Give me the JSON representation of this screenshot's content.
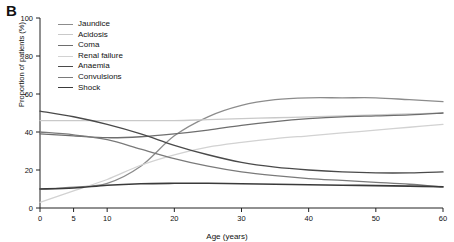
{
  "panel": {
    "label": "B"
  },
  "chart_data": {
    "type": "line",
    "title": "",
    "xlabel": "Age (years)",
    "ylabel": "Proportion of patients (%)",
    "xlim": [
      0,
      60
    ],
    "ylim": [
      0,
      100
    ],
    "xticks": [
      0,
      5,
      10,
      20,
      30,
      40,
      50,
      60
    ],
    "yticks": [
      0,
      20,
      40,
      60,
      80,
      100
    ],
    "grid": false,
    "legend_position": "top-left",
    "x": [
      0,
      5,
      10,
      15,
      20,
      25,
      30,
      35,
      40,
      45,
      50,
      55,
      60
    ],
    "series": [
      {
        "name": "Jaundice",
        "color": "#8c8c8c",
        "width": 1.3,
        "values": [
          10,
          11,
          13,
          22,
          38,
          48,
          54,
          57,
          58,
          58,
          58,
          57,
          56
        ]
      },
      {
        "name": "Acidosis",
        "color": "#c9c9c9",
        "width": 1.3,
        "values": [
          46,
          46,
          46,
          46,
          46,
          46.5,
          47,
          47.5,
          48,
          48.5,
          49,
          49.5,
          50
        ]
      },
      {
        "name": "Coma",
        "color": "#6e6e6e",
        "width": 1.3,
        "values": [
          39,
          38,
          37,
          37.5,
          39,
          41,
          43.5,
          45.5,
          47,
          48,
          48.5,
          49,
          50
        ]
      },
      {
        "name": "Renal failure",
        "color": "#d2d2d2",
        "width": 1.3,
        "values": [
          3,
          9,
          15,
          22.5,
          28,
          32,
          34.5,
          36.5,
          38,
          39.5,
          41,
          42.5,
          44
        ]
      },
      {
        "name": "Anaemia",
        "color": "#4a4a4a",
        "width": 1.4,
        "values": [
          51,
          48,
          44,
          39,
          33,
          28,
          24,
          21.5,
          20,
          19,
          18.5,
          18.5,
          19
        ]
      },
      {
        "name": "Convulsions",
        "color": "#7a7a7a",
        "width": 1.3,
        "values": [
          40,
          38.5,
          36,
          31,
          26,
          22,
          19,
          17,
          15.5,
          14.5,
          13.5,
          12.5,
          11
        ]
      },
      {
        "name": "Shock",
        "color": "#3a3a3a",
        "width": 1.6,
        "values": [
          10,
          10.5,
          12,
          12.8,
          13,
          13,
          12.8,
          12.5,
          12.2,
          12,
          11.8,
          11.5,
          11.2
        ]
      }
    ]
  }
}
